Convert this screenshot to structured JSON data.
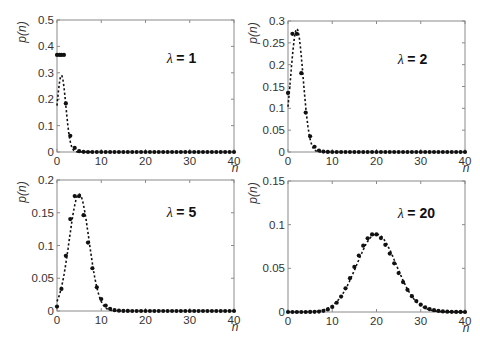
{
  "chart_data": [
    {
      "type": "scatter",
      "title": "λ = 1",
      "lambda_label": "= 1",
      "lambda": 1,
      "xlabel": "n",
      "ylabel": "p(n)",
      "xlim": [
        0,
        40
      ],
      "ylim": [
        0,
        0.5
      ],
      "xticks": [
        "0",
        "10",
        "20",
        "30",
        "40"
      ],
      "yticks": [
        "0",
        "0.1",
        "0.2",
        "0.3",
        "0.4",
        "0.5"
      ],
      "ytick_values": [
        0,
        0.1,
        0.2,
        0.3,
        0.4,
        0.5
      ],
      "series": [
        {
          "name": "Poisson p(n) (dots)",
          "x": [
            0,
            1,
            2,
            3,
            4,
            5,
            6,
            7,
            8,
            9,
            10
          ],
          "values": [
            0.368,
            0.368,
            0.184,
            0.061,
            0.015,
            0.003,
            0.0005,
            0.0001,
            0,
            0,
            0
          ]
        },
        {
          "name": "Gaussian approximation (dashed)",
          "style": "dashed"
        }
      ],
      "frame": {
        "left": 57,
        "top": 20,
        "right": 234,
        "bottom": 152
      }
    },
    {
      "type": "scatter",
      "title": "λ = 2",
      "lambda_label": "= 2",
      "lambda": 2,
      "xlabel": "n",
      "ylabel": "p(n)",
      "xlim": [
        0,
        40
      ],
      "ylim": [
        0,
        0.3
      ],
      "xticks": [
        "0",
        "10",
        "20",
        "30",
        "40"
      ],
      "yticks": [
        "0",
        "0.05",
        "0.1",
        "0.15",
        "0.2",
        "0.25",
        "0.3"
      ],
      "ytick_values": [
        0,
        0.05,
        0.1,
        0.15,
        0.2,
        0.25,
        0.3
      ],
      "series": [
        {
          "name": "Poisson p(n) (dots)",
          "x": [
            0,
            1,
            2,
            3,
            4,
            5,
            6,
            7,
            8,
            9,
            10
          ],
          "values": [
            0.135,
            0.271,
            0.271,
            0.18,
            0.09,
            0.036,
            0.012,
            0.0034,
            0.0009,
            0.0002,
            0
          ]
        },
        {
          "name": "Gaussian approximation (dashed)",
          "style": "dashed"
        }
      ],
      "frame": {
        "left": 288,
        "top": 21,
        "right": 465,
        "bottom": 152
      }
    },
    {
      "type": "scatter",
      "title": "λ = 5",
      "lambda_label": "= 5",
      "lambda": 5,
      "xlabel": "n",
      "ylabel": "p(n)",
      "xlim": [
        0,
        40
      ],
      "ylim": [
        0,
        0.2
      ],
      "xticks": [
        "0",
        "10",
        "20",
        "30",
        "40"
      ],
      "yticks": [
        "0",
        "0.05",
        "0.1",
        "0.15",
        "0.2"
      ],
      "ytick_values": [
        0,
        0.05,
        0.1,
        0.15,
        0.2
      ],
      "series": [
        {
          "name": "Poisson p(n) (dots)",
          "x": [
            0,
            1,
            2,
            3,
            4,
            5,
            6,
            7,
            8,
            9,
            10,
            11,
            12,
            13,
            14
          ],
          "values": [
            0.0067,
            0.034,
            0.084,
            0.14,
            0.175,
            0.175,
            0.146,
            0.104,
            0.065,
            0.036,
            0.018,
            0.008,
            0.0034,
            0.0013,
            0.0005
          ]
        },
        {
          "name": "Gaussian approximation (dashed)",
          "style": "dashed"
        }
      ],
      "frame": {
        "left": 57,
        "top": 180,
        "right": 234,
        "bottom": 311
      }
    },
    {
      "type": "scatter",
      "title": "λ = 20",
      "lambda_label": "= 20",
      "lambda": 20,
      "xlabel": "n",
      "ylabel": "p(n)",
      "xlim": [
        0,
        40
      ],
      "ylim": [
        0,
        0.15
      ],
      "xticks": [
        "0",
        "10",
        "20",
        "30",
        "40"
      ],
      "yticks": [
        "0",
        "0.05",
        "0.1",
        "0.15"
      ],
      "ytick_values": [
        0,
        0.05,
        0.1,
        0.15
      ],
      "series": [
        {
          "name": "Poisson p(n) (dots)",
          "x": [
            10,
            12,
            14,
            16,
            18,
            19,
            20,
            21,
            22,
            24,
            26,
            28,
            30
          ],
          "values": [
            0.0058,
            0.0176,
            0.0387,
            0.0646,
            0.0844,
            0.0888,
            0.0888,
            0.0846,
            0.0769,
            0.0557,
            0.031,
            0.0134,
            0.0083
          ]
        },
        {
          "name": "Gaussian approximation (dashed)",
          "style": "dashed"
        }
      ],
      "frame": {
        "left": 288,
        "top": 181,
        "right": 465,
        "bottom": 312
      }
    }
  ]
}
